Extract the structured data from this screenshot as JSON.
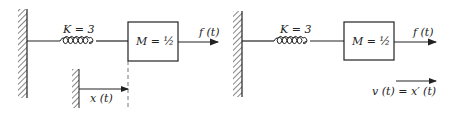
{
  "diagrams": [
    {
      "spring_label": "K = 3",
      "mass_label": "M = ½",
      "force_label": "f (t)",
      "displacement_label": "x (t)"
    },
    {
      "spring_label": "K = 3",
      "mass_label": "M = ½",
      "force_label": "f (t)",
      "velocity_label": "v (t) = x′ (t)"
    }
  ],
  "colors": {
    "ink": "#222222",
    "background": "#ffffff"
  }
}
